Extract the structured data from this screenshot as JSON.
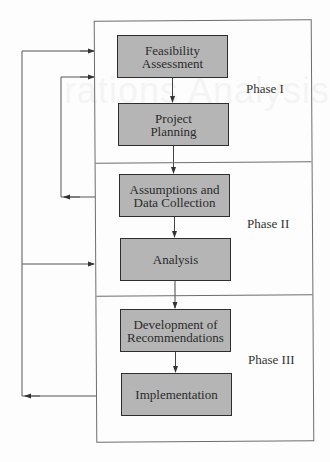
{
  "diagram": {
    "background_bleed_text": "rations Analysis",
    "colors": {
      "box_fill": "#b5b5b5",
      "box_border": "#2e2e2e",
      "frame_line": "#6d6d6d",
      "arrow": "#444444"
    },
    "phases": [
      {
        "label": "Phase I"
      },
      {
        "label": "Phase II"
      },
      {
        "label": "Phase III"
      }
    ],
    "steps": [
      {
        "line1": "Feasibility",
        "line2": "Assessment",
        "phase": "Phase I"
      },
      {
        "line1": "Project",
        "line2": "Planning",
        "phase": "Phase I"
      },
      {
        "line1": "Assumptions and",
        "line2": "Data Collection",
        "phase": "Phase II"
      },
      {
        "line1": "Analysis",
        "line2": "",
        "phase": "Phase II"
      },
      {
        "line1": "Development of",
        "line2": "Recommendations",
        "phase": "Phase III"
      },
      {
        "line1": "Implementation",
        "line2": "",
        "phase": "Phase III"
      }
    ],
    "flows": [
      {
        "from": "Feasibility Assessment",
        "to": "Project Planning"
      },
      {
        "from": "Project Planning",
        "to": "Assumptions and Data Collection"
      },
      {
        "from": "Assumptions and Data Collection",
        "to": "Analysis"
      },
      {
        "from": "Analysis",
        "to": "Development of Recommendations"
      },
      {
        "from": "Development of Recommendations",
        "to": "Implementation"
      }
    ],
    "feedback_loops": [
      {
        "from": "Phase II (Assumptions and Data Collection)",
        "to": "Phase I (Project Planning)"
      },
      {
        "from": "Phase III (Implementation)",
        "to": "Phase I (Feasibility Assessment)"
      },
      {
        "from": "Phase III (Implementation)",
        "to": "Phase II (Analysis)"
      }
    ]
  }
}
